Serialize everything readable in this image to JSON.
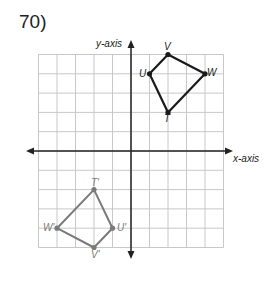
{
  "problem": {
    "number_label": "70)"
  },
  "axes": {
    "x_label": "x-axis",
    "y_label": "y-axis"
  },
  "grid": {
    "x_min": -5,
    "x_max": 5,
    "y_min": -5,
    "y_max": 5,
    "origin_px": [
      131,
      151
    ],
    "unit_px": [
      18.5,
      19.3
    ]
  },
  "colors": {
    "original": "#1a1a1a",
    "image": "#7a7a7a",
    "grid": "#c8c8c8",
    "axis": "#222222"
  },
  "chart_data": {
    "type": "scatter",
    "title": "70)",
    "xlabel": "x-axis",
    "ylabel": "y-axis",
    "xlim": [
      -5,
      5
    ],
    "ylim": [
      -5,
      5
    ],
    "grid": true,
    "series": [
      {
        "name": "TUVW (original)",
        "points": [
          {
            "label": "T",
            "x": 2,
            "y": 2
          },
          {
            "label": "U",
            "x": 1,
            "y": 4
          },
          {
            "label": "V",
            "x": 2,
            "y": 5
          },
          {
            "label": "W",
            "x": 4,
            "y": 4
          }
        ]
      },
      {
        "name": "T'U'V'W' (image)",
        "points": [
          {
            "label": "T'",
            "x": -2,
            "y": -2
          },
          {
            "label": "U'",
            "x": -1,
            "y": -4
          },
          {
            "label": "V'",
            "x": -2,
            "y": -5
          },
          {
            "label": "W'",
            "x": -4,
            "y": -4
          }
        ]
      }
    ]
  },
  "labels": {
    "T": "T",
    "U": "U",
    "V": "V",
    "W": "W",
    "Tp": "T'",
    "Up": "U'",
    "Vp": "V'",
    "Wp": "W'"
  }
}
